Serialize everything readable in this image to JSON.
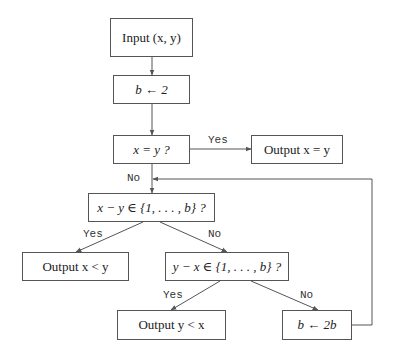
{
  "nodes": {
    "input": {
      "label": "Input (x, y)"
    },
    "init_b": {
      "label": "b ← 2"
    },
    "check_equal": {
      "label": "x = y ?"
    },
    "output_equal": {
      "label": "Output x = y"
    },
    "check_x_minus_y": {
      "label": "x − y ∈ {1, . . . , b} ?"
    },
    "output_x_less": {
      "label": "Output x < y"
    },
    "check_y_minus_x": {
      "label": "y − x ∈ {1, . . . , b} ?"
    },
    "output_y_less": {
      "label": "Output y < x"
    },
    "double_b": {
      "label": "b ← 2b"
    }
  },
  "edge_labels": {
    "equal_yes": "Yes",
    "equal_no": "No",
    "xmy_yes": "Yes",
    "xmy_no": "No",
    "ymx_yes": "Yes",
    "ymx_no": "No"
  },
  "colors": {
    "stroke": "#555555",
    "text": "#222222",
    "background": "#ffffff"
  }
}
